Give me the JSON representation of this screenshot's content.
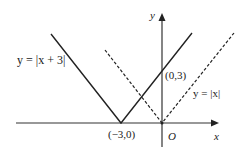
{
  "diagram": {
    "axes": {
      "x_label": "x",
      "y_label": "y",
      "origin_label": "O"
    },
    "curves": [
      {
        "name": "y = |x + 3|",
        "label": "y = |x + 3|",
        "style": "solid",
        "vertex": [
          -3,
          0
        ]
      },
      {
        "name": "y = |x|",
        "label": "y = |x|",
        "style": "dashed",
        "vertex": [
          0,
          0
        ]
      }
    ],
    "points": [
      {
        "label": "(−3,0)",
        "coords": [
          -3,
          0
        ]
      },
      {
        "label": "(0,3)",
        "coords": [
          0,
          3
        ]
      }
    ],
    "colors": {
      "line": "#222222",
      "background": "#ffffff"
    }
  }
}
